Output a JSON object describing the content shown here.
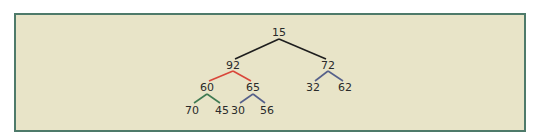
{
  "diagram": {
    "type": "binary-tree",
    "edge_colors": {
      "default": "#1e1e1e",
      "highlight": "#d9463a",
      "green": "#3f7a52",
      "blue": "#55608a"
    },
    "nodes": [
      {
        "id": "n15",
        "label": "15"
      },
      {
        "id": "n92",
        "label": "92"
      },
      {
        "id": "n72",
        "label": "72"
      },
      {
        "id": "n60",
        "label": "60"
      },
      {
        "id": "n65",
        "label": "65"
      },
      {
        "id": "n32",
        "label": "32"
      },
      {
        "id": "n62",
        "label": "62"
      },
      {
        "id": "n70",
        "label": "70"
      },
      {
        "id": "n45",
        "label": "45"
      },
      {
        "id": "n30",
        "label": "30"
      },
      {
        "id": "n56",
        "label": "56"
      }
    ],
    "edges": [
      {
        "from": "n15",
        "to": "n92",
        "color": "default"
      },
      {
        "from": "n15",
        "to": "n72",
        "color": "default"
      },
      {
        "from": "n92",
        "to": "n60",
        "color": "highlight"
      },
      {
        "from": "n92",
        "to": "n65",
        "color": "highlight"
      },
      {
        "from": "n72",
        "to": "n32",
        "color": "blue"
      },
      {
        "from": "n72",
        "to": "n62",
        "color": "blue"
      },
      {
        "from": "n60",
        "to": "n70",
        "color": "green"
      },
      {
        "from": "n60",
        "to": "n45",
        "color": "green"
      },
      {
        "from": "n65",
        "to": "n30",
        "color": "blue"
      },
      {
        "from": "n65",
        "to": "n56",
        "color": "blue"
      }
    ]
  }
}
